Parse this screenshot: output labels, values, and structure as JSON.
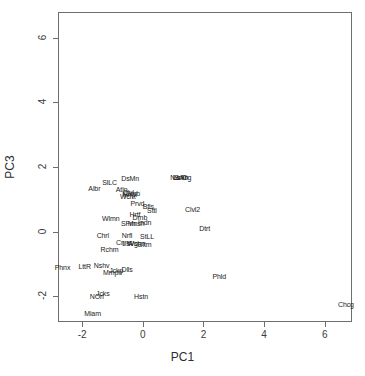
{
  "figure": {
    "width": 365,
    "height": 376,
    "background": "#ffffff",
    "frame_color": "#6e6e6e",
    "point_color": "#1a1a1a"
  },
  "chart_data": {
    "type": "scatter",
    "title": "",
    "xlabel": "PC1",
    "ylabel": "PC3",
    "xlim": [
      -2.8,
      6.9
    ],
    "ylim": [
      -2.8,
      6.8
    ],
    "xticks": [
      -2,
      0,
      2,
      4,
      6
    ],
    "xticklabels": [
      "-2",
      "0",
      "2",
      "4",
      "6"
    ],
    "yticks": [
      -2,
      0,
      2,
      4,
      6
    ],
    "yticklabels": [
      "-2",
      "0",
      "2",
      "4",
      "6"
    ],
    "grid": false,
    "legend": null,
    "marker": "text-label",
    "points": [
      {
        "label": "Phnx",
        "x": -2.65,
        "y": -1.1
      },
      {
        "label": "Albr",
        "x": -1.6,
        "y": 1.35
      },
      {
        "label": "SlLC",
        "x": -1.1,
        "y": 1.53
      },
      {
        "label": "DsMn",
        "x": -0.42,
        "y": 1.65
      },
      {
        "label": "Atln",
        "x": -0.7,
        "y": 1.32
      },
      {
        "label": "Clvl",
        "x": -0.48,
        "y": 1.22
      },
      {
        "label": "Clmb",
        "x": -0.36,
        "y": 1.2
      },
      {
        "label": "Mnpl",
        "x": -0.44,
        "y": 1.15
      },
      {
        "label": "Wcht",
        "x": -0.5,
        "y": 1.1
      },
      {
        "label": "Prvd",
        "x": -0.18,
        "y": 0.88
      },
      {
        "label": "Bfls",
        "x": 0.18,
        "y": 0.78
      },
      {
        "label": "Sttl",
        "x": 0.3,
        "y": 0.66
      },
      {
        "label": "Hrtf",
        "x": -0.26,
        "y": 0.55
      },
      {
        "label": "Drnb",
        "x": -0.1,
        "y": 0.45
      },
      {
        "label": "Wlmn",
        "x": -1.06,
        "y": 0.42
      },
      {
        "label": "SFrn",
        "x": -0.48,
        "y": 0.28
      },
      {
        "label": "Mnsh",
        "x": -0.22,
        "y": 0.28
      },
      {
        "label": "Indn",
        "x": 0.06,
        "y": 0.3
      },
      {
        "label": "Chrl",
        "x": -1.32,
        "y": -0.12
      },
      {
        "label": "Nrfl",
        "x": -0.52,
        "y": -0.12
      },
      {
        "label": "StLL",
        "x": 0.14,
        "y": -0.15
      },
      {
        "label": "Cnnc",
        "x": -0.62,
        "y": -0.32
      },
      {
        "label": "LsVg",
        "x": -0.42,
        "y": -0.36
      },
      {
        "label": "Wshn",
        "x": -0.22,
        "y": -0.36
      },
      {
        "label": "Bltm",
        "x": 0.06,
        "y": -0.38
      },
      {
        "label": "Rchm",
        "x": -1.1,
        "y": -0.55
      },
      {
        "label": "LttR",
        "x": -1.92,
        "y": -1.06
      },
      {
        "label": "Nshv",
        "x": -1.36,
        "y": -1.04
      },
      {
        "label": "Mmph",
        "x": -1.0,
        "y": -1.26
      },
      {
        "label": "Jckp",
        "x": -0.88,
        "y": -1.18
      },
      {
        "label": "Dlls",
        "x": -0.52,
        "y": -1.15
      },
      {
        "label": "NOrl",
        "x": -1.52,
        "y": -2.0
      },
      {
        "label": "Jcks",
        "x": -1.32,
        "y": -1.9
      },
      {
        "label": "Hstn",
        "x": -0.06,
        "y": -2.0
      },
      {
        "label": "Miam",
        "x": -1.66,
        "y": -2.52
      },
      {
        "label": "NwYr",
        "x": 1.18,
        "y": 1.7
      },
      {
        "label": "LsAn",
        "x": 1.24,
        "y": 1.7
      },
      {
        "label": "SnDg",
        "x": 1.32,
        "y": 1.7
      },
      {
        "label": "Phld",
        "x": 2.52,
        "y": -1.38
      },
      {
        "label": "Clvl2",
        "x": 1.64,
        "y": 0.7
      },
      {
        "label": "Dtrt",
        "x": 2.04,
        "y": 0.1
      },
      {
        "label": "Chcg",
        "x": 6.7,
        "y": -2.25
      }
    ]
  }
}
